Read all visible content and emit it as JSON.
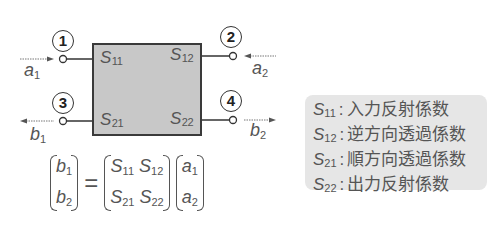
{
  "diagram": {
    "type": "two-port S-parameter network",
    "box": {
      "fill": "#c8c8c8",
      "border": "#3a3a3a",
      "labels": [
        {
          "id": "S11",
          "main": "S",
          "sub": "11"
        },
        {
          "id": "S12",
          "main": "S",
          "sub": "12"
        },
        {
          "id": "S21",
          "main": "S",
          "sub": "21"
        },
        {
          "id": "S22",
          "main": "S",
          "sub": "22"
        }
      ]
    },
    "ports": [
      {
        "number": "1",
        "position": "top-left"
      },
      {
        "number": "2",
        "position": "top-right"
      },
      {
        "number": "3",
        "position": "bottom-left"
      },
      {
        "number": "4",
        "position": "bottom-right"
      }
    ],
    "signals": [
      {
        "id": "a1",
        "main": "a",
        "sub": "1",
        "direction": "into port 1"
      },
      {
        "id": "a2",
        "main": "a",
        "sub": "2",
        "direction": "into port 2"
      },
      {
        "id": "b1",
        "main": "b",
        "sub": "1",
        "direction": "out of port 3"
      },
      {
        "id": "b2",
        "main": "b",
        "sub": "2",
        "direction": "out of port 4"
      }
    ]
  },
  "equation": {
    "lhs": [
      {
        "main": "b",
        "sub": "1"
      },
      {
        "main": "b",
        "sub": "2"
      }
    ],
    "equals": "=",
    "matrix": [
      [
        {
          "main": "S",
          "sub": "11"
        },
        {
          "main": "S",
          "sub": "12"
        }
      ],
      [
        {
          "main": "S",
          "sub": "21"
        },
        {
          "main": "S",
          "sub": "22"
        }
      ]
    ],
    "rhs": [
      {
        "main": "a",
        "sub": "1"
      },
      {
        "main": "a",
        "sub": "2"
      }
    ]
  },
  "legend": {
    "background": "#e6e6e6",
    "items": [
      {
        "main": "S",
        "sub": "11",
        "colon": ":",
        "text": "入力反射係数"
      },
      {
        "main": "S",
        "sub": "12",
        "colon": ":",
        "text": "逆方向透過係数"
      },
      {
        "main": "S",
        "sub": "21",
        "colon": ":",
        "text": "順方向透過係数"
      },
      {
        "main": "S",
        "sub": "22",
        "colon": ":",
        "text": "出力反射係数"
      }
    ]
  }
}
